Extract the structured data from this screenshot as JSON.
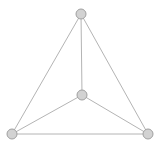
{
  "diagram": {
    "type": "graph",
    "width": 160,
    "height": 148,
    "style": {
      "background": "#ffffff",
      "edge_color": "#b4b4b4",
      "node_fill": "#d2d2d2",
      "node_stroke": "#a0a0a0",
      "node_radius": 5
    },
    "nodes": [
      {
        "id": "top",
        "x": 81,
        "y": 14
      },
      {
        "id": "center",
        "x": 82,
        "y": 95
      },
      {
        "id": "bottom-left",
        "x": 12,
        "y": 134
      },
      {
        "id": "bottom-right",
        "x": 148,
        "y": 134
      }
    ],
    "edges": [
      {
        "from": "top",
        "to": "bottom-left"
      },
      {
        "from": "top",
        "to": "bottom-right"
      },
      {
        "from": "top",
        "to": "center"
      },
      {
        "from": "center",
        "to": "bottom-left"
      },
      {
        "from": "center",
        "to": "bottom-right"
      },
      {
        "from": "bottom-left",
        "to": "bottom-right"
      }
    ]
  }
}
